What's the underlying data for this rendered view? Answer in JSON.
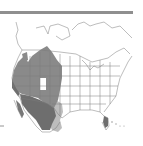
{
  "figure": {
    "type": "species-range-map",
    "region": "North America",
    "rule_color": "#8f8f8f",
    "legend": {
      "year_round": {
        "label": "Year-round range",
        "color": "#8a8a8a"
      },
      "winter": {
        "label": "Winter range",
        "color": "#6e6e6e"
      },
      "breeding_edge": {
        "label": "Non-breeding range",
        "color": "#bdbdbd"
      },
      "absent": {
        "label": "Absent",
        "color": "#ffffff"
      }
    },
    "outline_color": "#7a7a7a"
  }
}
